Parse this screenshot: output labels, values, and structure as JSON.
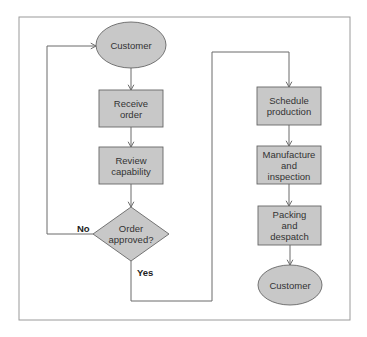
{
  "diagram": {
    "type": "flowchart",
    "frame": {
      "x": 19,
      "y": 17,
      "width": 331,
      "height": 303,
      "stroke": "#9a9a9a"
    },
    "colors": {
      "fill": "#c8c8c8",
      "stroke": "#666666",
      "line": "#6a6a6a",
      "text": "#333333"
    },
    "nodes": [
      {
        "id": "customer_start",
        "shape": "ellipse",
        "lines": [
          "Customer"
        ],
        "cx": 131,
        "cy": 45,
        "rx": 35,
        "ry": 23
      },
      {
        "id": "receive_order",
        "shape": "rect",
        "lines": [
          "Receive",
          "order"
        ],
        "x": 99,
        "y": 90,
        "w": 64,
        "h": 37
      },
      {
        "id": "review_capability",
        "shape": "rect",
        "lines": [
          "Review",
          "capability"
        ],
        "x": 99,
        "y": 147,
        "w": 64,
        "h": 37
      },
      {
        "id": "order_approved",
        "shape": "diamond",
        "lines": [
          "Order",
          "approved?"
        ],
        "cx": 131,
        "cy": 234,
        "hw": 38,
        "hh": 27
      },
      {
        "id": "schedule_production",
        "shape": "rect",
        "lines": [
          "Schedule",
          "production"
        ],
        "x": 257,
        "y": 87,
        "w": 64,
        "h": 38
      },
      {
        "id": "manufacture_inspection",
        "shape": "rect",
        "lines": [
          "Manufacture",
          "and",
          "inspection"
        ],
        "x": 257,
        "y": 146,
        "w": 64,
        "h": 38
      },
      {
        "id": "packing_despatch",
        "shape": "rect",
        "lines": [
          "Packing",
          "and",
          "despatch"
        ],
        "x": 258,
        "y": 206,
        "w": 63,
        "h": 39
      },
      {
        "id": "customer_end",
        "shape": "ellipse",
        "lines": [
          "Customer"
        ],
        "cx": 290,
        "cy": 285,
        "rx": 32,
        "ry": 20
      }
    ],
    "edges": [
      {
        "from": "customer_start",
        "to": "receive_order",
        "points": [
          [
            131,
            68
          ],
          [
            131,
            90
          ]
        ]
      },
      {
        "from": "receive_order",
        "to": "review_capability",
        "points": [
          [
            131,
            127
          ],
          [
            131,
            147
          ]
        ]
      },
      {
        "from": "review_capability",
        "to": "order_approved",
        "points": [
          [
            131,
            184
          ],
          [
            131,
            207
          ]
        ]
      },
      {
        "from": "order_approved",
        "to": "customer_start",
        "label": "No",
        "points": [
          [
            93,
            234
          ],
          [
            47,
            234
          ],
          [
            47,
            46
          ],
          [
            96,
            46
          ]
        ]
      },
      {
        "from": "order_approved",
        "to": "schedule_production",
        "label": "Yes",
        "points": [
          [
            131,
            261
          ],
          [
            131,
            301
          ],
          [
            212,
            301
          ],
          [
            212,
            52
          ],
          [
            289,
            52
          ],
          [
            289,
            87
          ]
        ]
      },
      {
        "from": "schedule_production",
        "to": "manufacture_inspection",
        "points": [
          [
            289,
            125
          ],
          [
            289,
            146
          ]
        ]
      },
      {
        "from": "manufacture_inspection",
        "to": "packing_despatch",
        "points": [
          [
            289,
            184
          ],
          [
            289,
            206
          ]
        ]
      },
      {
        "from": "packing_despatch",
        "to": "customer_end",
        "points": [
          [
            290,
            245
          ],
          [
            290,
            265
          ]
        ]
      }
    ],
    "edge_labels": [
      {
        "text": "No",
        "x": 77,
        "y": 232
      },
      {
        "text": "Yes",
        "x": 137,
        "y": 276
      }
    ]
  }
}
